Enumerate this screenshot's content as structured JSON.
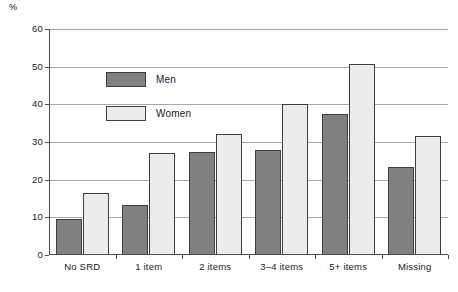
{
  "chart_data": {
    "type": "bar",
    "title": "",
    "subtitle": "",
    "xlabel": "",
    "ylabel": "%",
    "ylim": [
      0,
      60
    ],
    "ytick_step": 10,
    "yticks": [
      0,
      10,
      20,
      30,
      40,
      50,
      60
    ],
    "grid": true,
    "legend_position": "upper-left-inside",
    "categories": [
      "No SRD",
      "1 item",
      "2 items",
      "3–4 items",
      "5+ items",
      "Missing"
    ],
    "series": [
      {
        "name": "Men",
        "color": "#808080",
        "values": [
          9.5,
          13.4,
          27.3,
          27.9,
          37.5,
          23.4
        ]
      },
      {
        "name": "Women",
        "color": "#ececec",
        "values": [
          16.4,
          27.0,
          32.2,
          40.0,
          50.6,
          31.6
        ]
      }
    ]
  },
  "axis": {
    "unit_label": "%",
    "ytick_labels": [
      "60",
      "50",
      "40",
      "30",
      "20",
      "10",
      "0"
    ]
  },
  "legend": {
    "items": [
      {
        "label": "Men"
      },
      {
        "label": "Women"
      }
    ]
  }
}
